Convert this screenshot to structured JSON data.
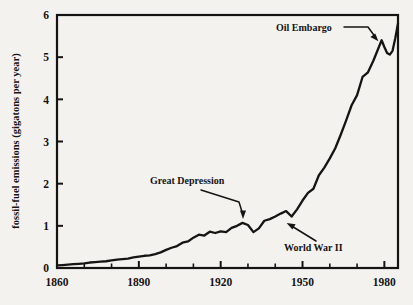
{
  "figure": {
    "background_color": "#f4f2ef",
    "ink_color": "#161412",
    "ylabel": "fossil-fuel emissions  (gigatons per year)"
  },
  "chart_data": {
    "type": "line",
    "title": "",
    "xlabel": "",
    "ylabel": "fossil-fuel emissions  (gigatons per year)",
    "xlim": [
      1860,
      1985
    ],
    "ylim": [
      0,
      6
    ],
    "grid": false,
    "legend": null,
    "x_major_ticks": [
      1860,
      1890,
      1920,
      1950,
      1980
    ],
    "x_major_tick_labels": [
      "1860",
      "1890",
      "1920",
      "1950",
      "1980"
    ],
    "x_minor_ticks": [
      1870,
      1880,
      1900,
      1910,
      1930,
      1940,
      1960,
      1970
    ],
    "y_major_ticks": [
      0,
      1,
      2,
      3,
      4,
      5,
      6
    ],
    "y_major_tick_labels": [
      "0",
      "1",
      "2",
      "3",
      "4",
      "5",
      "6"
    ],
    "series": [
      {
        "name": "fossil-fuel emissions",
        "color": "#161412",
        "x": [
          1860,
          1862,
          1864,
          1866,
          1868,
          1870,
          1872,
          1874,
          1876,
          1878,
          1880,
          1882,
          1884,
          1886,
          1888,
          1890,
          1892,
          1894,
          1896,
          1898,
          1900,
          1902,
          1904,
          1906,
          1908,
          1910,
          1912,
          1914,
          1916,
          1918,
          1920,
          1922,
          1924,
          1926,
          1928,
          1930,
          1932,
          1934,
          1936,
          1938,
          1940,
          1942,
          1944,
          1946,
          1948,
          1950,
          1952,
          1954,
          1956,
          1958,
          1960,
          1962,
          1964,
          1966,
          1968,
          1970,
          1972,
          1974,
          1976,
          1978,
          1979,
          1980,
          1981,
          1982,
          1983,
          1984,
          1985
        ],
        "y": [
          0.06,
          0.07,
          0.08,
          0.09,
          0.1,
          0.11,
          0.13,
          0.14,
          0.15,
          0.16,
          0.18,
          0.2,
          0.21,
          0.22,
          0.25,
          0.27,
          0.29,
          0.3,
          0.33,
          0.37,
          0.43,
          0.48,
          0.52,
          0.6,
          0.63,
          0.72,
          0.79,
          0.77,
          0.86,
          0.83,
          0.87,
          0.85,
          0.95,
          1.0,
          1.07,
          1.02,
          0.85,
          0.94,
          1.12,
          1.16,
          1.22,
          1.29,
          1.35,
          1.22,
          1.39,
          1.6,
          1.78,
          1.88,
          2.2,
          2.38,
          2.6,
          2.84,
          3.16,
          3.5,
          3.86,
          4.1,
          4.53,
          4.64,
          4.92,
          5.24,
          5.4,
          5.24,
          5.1,
          5.06,
          5.15,
          5.45,
          5.8
        ]
      }
    ],
    "annotations": [
      {
        "label": "Great Depression",
        "x": 1933,
        "y": 0.85,
        "note": "labeled dip at Great Depression"
      },
      {
        "label": "World War II",
        "x": 1945,
        "y": 1.22,
        "note": "labeled dip at World War II"
      },
      {
        "label": "Oil Embargo",
        "x": 1979,
        "y": 5.4,
        "note": "labeled peak before post-embargo decline"
      }
    ]
  },
  "annotation_labels": {
    "great_depression": "Great Depression",
    "world_war_ii": "World War II",
    "oil_embargo": "Oil Embargo"
  }
}
